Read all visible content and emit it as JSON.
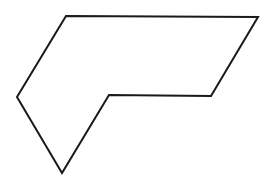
{
  "shape": {
    "type": "polygon",
    "stroke": "#1a1a1a",
    "fill": "#ffffff",
    "stroke_width": 2,
    "points": "66,16 258,17 211,96 109,95 62,173 17,97"
  }
}
